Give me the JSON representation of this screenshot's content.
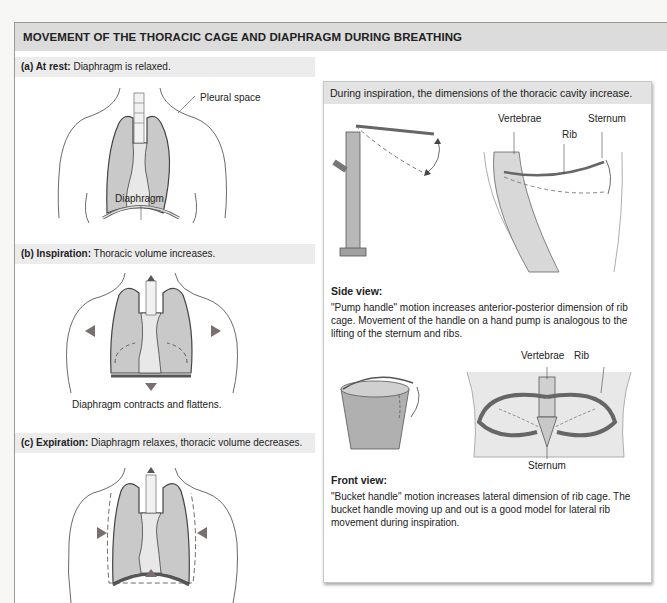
{
  "title": "MOVEMENT OF THE THORACIC CAGE AND DIAPHRAGM DURING BREATHING",
  "sections": [
    {
      "id": "a",
      "heading_bold": "(a) At rest:",
      "heading_text": " Diaphragm is relaxed.",
      "labels": {
        "pleural_space": "Pleural space",
        "diaphragm": "Diaphragm"
      }
    },
    {
      "id": "b",
      "heading_bold": "(b) Inspiration:",
      "heading_text": " Thoracic volume increases.",
      "caption": "Diaphragm contracts and flattens."
    },
    {
      "id": "c",
      "heading_bold": "(c) Expiration:",
      "heading_text": " Diaphragm relaxes, thoracic volume decreases."
    }
  ],
  "right_panel": {
    "heading": "During inspiration, the dimensions of the thoracic cavity increase.",
    "side_view": {
      "labels": {
        "vertebrae": "Vertebrae",
        "rib": "Rib",
        "sternum": "Sternum"
      },
      "title": "Side view:",
      "text": "\"Pump handle\" motion increases anterior-posterior dimension of rib cage. Movement of the handle on a hand pump is analogous to the lifting of the sternum and ribs."
    },
    "front_view": {
      "labels": {
        "vertebrae": "Vertebrae",
        "rib": "Rib",
        "sternum": "Sternum"
      },
      "title": "Front view:",
      "text": "\"Bucket handle\" motion increases lateral dimension of rib cage. The bucket handle moving up and out is a good model for lateral rib movement during inspiration."
    }
  },
  "colors": {
    "lung_fill": "#c9c9c9",
    "arrow": "#7a6e6e",
    "header_bg": "#dcdcdc"
  }
}
